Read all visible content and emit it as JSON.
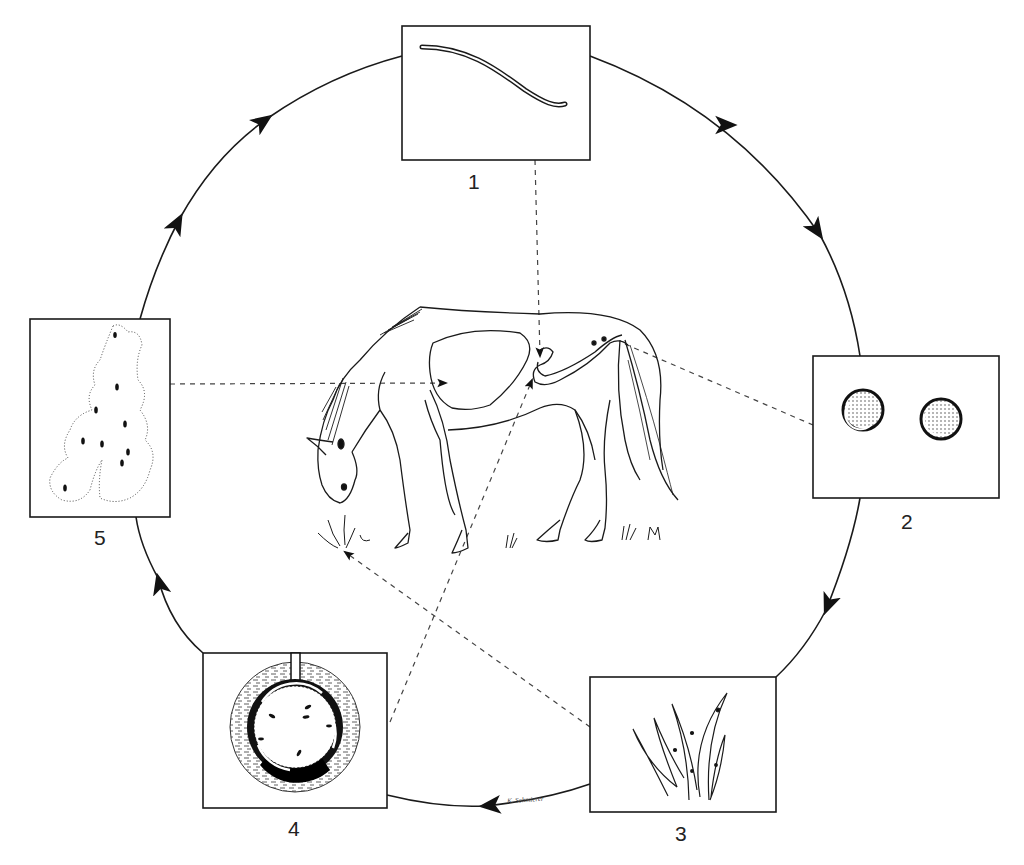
{
  "colors": {
    "ink": "#1a1a1a",
    "background": "#ffffff",
    "dashed": "#444444"
  },
  "cycle": {
    "shape": "circle",
    "center": [
      510,
      446
    ],
    "radius": 385,
    "direction": "clockwise",
    "arrowheads": 9
  },
  "stages": [
    {
      "id": 1,
      "label": "1",
      "box": [
        402,
        26,
        590,
        160
      ],
      "depiction": "adult worm",
      "icon": "worm-icon"
    },
    {
      "id": 2,
      "label": "2",
      "box": [
        813,
        356,
        999,
        498
      ],
      "depiction": "eggs in feces",
      "icon": "egg-icon"
    },
    {
      "id": 3,
      "label": "3",
      "box": [
        590,
        677,
        776,
        812
      ],
      "depiction": "infective larvae on grass blades",
      "icon": "grass-icon"
    },
    {
      "id": 4,
      "label": "4",
      "box": [
        203,
        653,
        387,
        808
      ],
      "depiction": "larvae in cross-section of artery / nodule",
      "icon": "artery-cross-section-icon"
    },
    {
      "id": 5,
      "label": "5",
      "box": [
        30,
        319,
        170,
        517
      ],
      "depiction": "larvae migrating in liver tissue",
      "icon": "liver-tissue-icon"
    }
  ],
  "host": {
    "name": "horse",
    "pose": "grazing",
    "icon": "horse-icon"
  },
  "dashed_links": [
    {
      "from": "stage-1",
      "to": "host-intestine"
    },
    {
      "from": "host-rectum",
      "to": "stage-2"
    },
    {
      "from": "stage-3",
      "to": "host-mouth-grass"
    },
    {
      "from": "stage-4",
      "to": "host-intestine"
    },
    {
      "from": "stage-5",
      "to": "host-liver"
    }
  ],
  "signature": "K. Schmierer"
}
